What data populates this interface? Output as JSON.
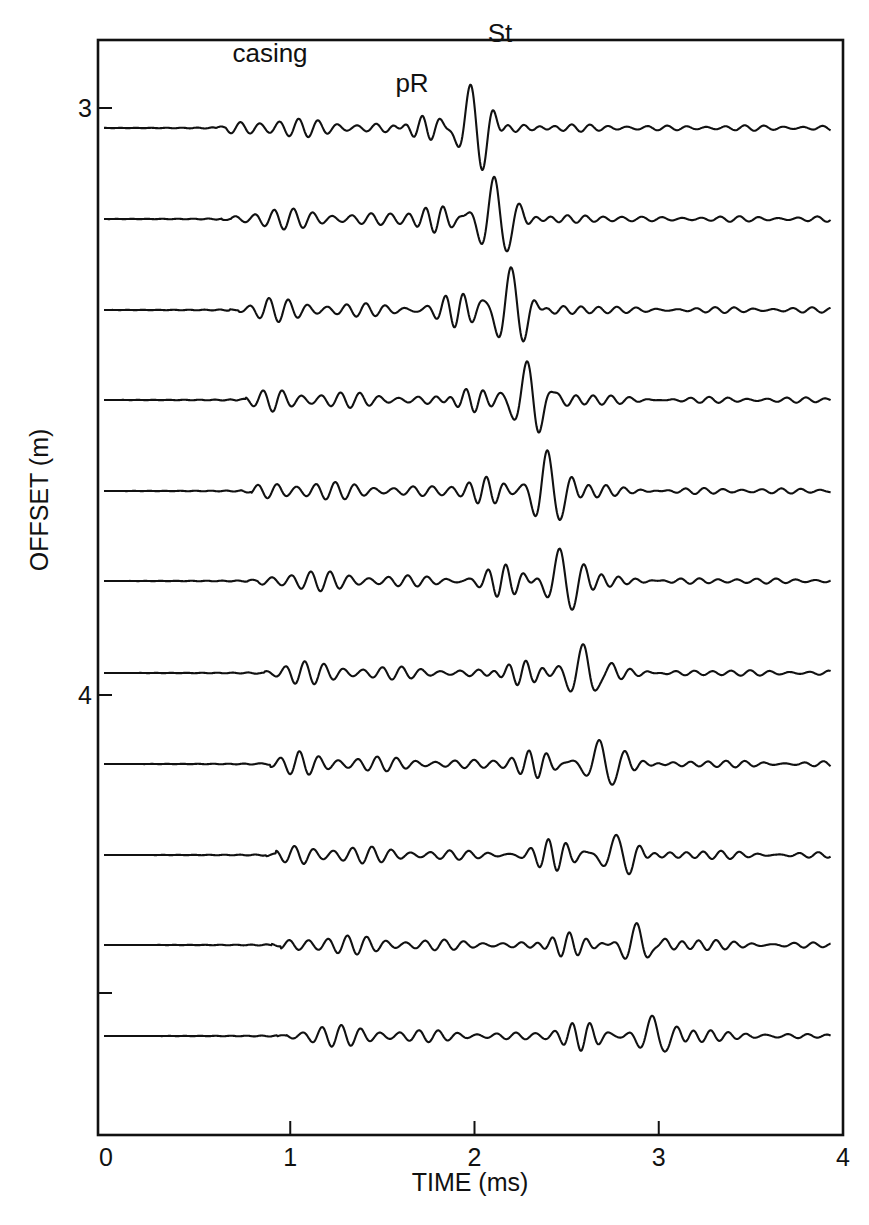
{
  "chart_data": {
    "type": "line",
    "subtype": "seismic-waveform-array",
    "title": "",
    "xlabel": "TIME (ms)",
    "ylabel": "OFFSET (m)",
    "xlim": [
      0,
      4
    ],
    "x_ticks": [
      0,
      1,
      2,
      3,
      4
    ],
    "x_tick_labels": [
      "0",
      "1",
      "2",
      "3",
      "4"
    ],
    "y_ticks": [
      3,
      4,
      4.5
    ],
    "y_tick_labels": [
      "3",
      "4",
      ""
    ],
    "ylim_top_to_bottom": [
      2.9,
      4.75
    ],
    "grid": false,
    "legend": null,
    "annotations": [
      {
        "text": "casing",
        "time_ms": 0.9
      },
      {
        "text": "pR",
        "time_ms": 1.65
      },
      {
        "text": "St",
        "time_ms": 2.07
      }
    ],
    "series": [
      {
        "name": "trace-1",
        "offset_m": 3.0,
        "casing_onset_ms": 0.65,
        "pR_ms": 1.72,
        "st_peak_ms": 2.0,
        "st_amp": 1.0
      },
      {
        "name": "trace-2",
        "offset_m": 3.1,
        "casing_onset_ms": 0.68,
        "pR_ms": 1.8,
        "st_peak_ms": 2.12,
        "st_amp": 1.0
      },
      {
        "name": "trace-3",
        "offset_m": 3.2,
        "casing_onset_ms": 0.72,
        "pR_ms": 1.9,
        "st_peak_ms": 2.2,
        "st_amp": 1.0
      },
      {
        "name": "trace-4",
        "offset_m": 3.3,
        "casing_onset_ms": 0.76,
        "pR_ms": 1.98,
        "st_peak_ms": 2.3,
        "st_amp": 0.95
      },
      {
        "name": "trace-5",
        "offset_m": 3.4,
        "casing_onset_ms": 0.79,
        "pR_ms": 2.07,
        "st_peak_ms": 2.4,
        "st_amp": 0.9
      },
      {
        "name": "trace-6",
        "offset_m": 3.5,
        "casing_onset_ms": 0.82,
        "pR_ms": 2.15,
        "st_peak_ms": 2.48,
        "st_amp": 0.75
      },
      {
        "name": "trace-7",
        "offset_m": 3.6,
        "casing_onset_ms": 0.86,
        "pR_ms": 2.25,
        "st_peak_ms": 2.6,
        "st_amp": 0.7
      },
      {
        "name": "trace-8",
        "offset_m": 3.7,
        "casing_onset_ms": 0.89,
        "pR_ms": 2.33,
        "st_peak_ms": 2.7,
        "st_amp": 0.6
      },
      {
        "name": "trace-9",
        "offset_m": 3.8,
        "casing_onset_ms": 0.92,
        "pR_ms": 2.42,
        "st_peak_ms": 2.78,
        "st_amp": 0.5
      },
      {
        "name": "trace-10",
        "offset_m": 3.9,
        "casing_onset_ms": 0.95,
        "pR_ms": 2.5,
        "st_peak_ms": 2.88,
        "st_amp": 0.45
      },
      {
        "name": "trace-11",
        "offset_m": 4.0,
        "casing_onset_ms": 0.98,
        "pR_ms": 2.58,
        "st_peak_ms": 2.98,
        "st_amp": 0.45
      }
    ]
  },
  "layout": {
    "plot_left_px": 106,
    "plot_right_px": 843,
    "plot_top_px": 40,
    "plot_bottom_px": 1135,
    "trace_baselines_px": [
      128,
      219,
      310,
      400,
      491,
      581,
      673,
      764,
      855,
      945,
      1036
    ],
    "y_tick_px": [
      108,
      695,
      993
    ],
    "line_color": "#111111"
  }
}
